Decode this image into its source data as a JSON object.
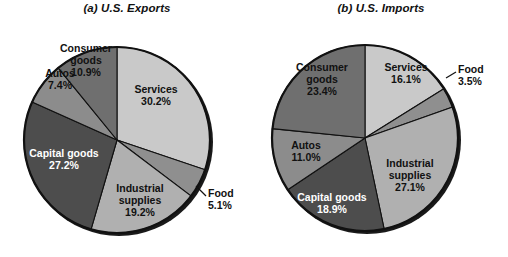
{
  "figure": {
    "background": "#ffffff",
    "panels": [
      {
        "id": "exports",
        "title": "(a) U.S. Exports",
        "center": {
          "x": 117,
          "y": 140
        },
        "radius": 93
      },
      {
        "id": "imports",
        "title": "(b) U.S. Imports",
        "center": {
          "x": 111,
          "y": 138
        },
        "radius": 93
      }
    ]
  },
  "chart_data": [
    {
      "type": "pie",
      "title": "(a) U.S. Exports",
      "xlabel": "",
      "ylabel": "",
      "legend": "none",
      "start_angle_deg": 0,
      "direction": "clockwise",
      "categories": [
        "Services",
        "Food",
        "Industrial supplies",
        "Capital goods",
        "Autos",
        "Consumer goods"
      ],
      "values": [
        30.2,
        5.1,
        19.2,
        27.2,
        7.4,
        10.9
      ],
      "value_labels": [
        "30.2%",
        "5.1%",
        "19.2%",
        "27.2%",
        "7.4%",
        "10.9%"
      ],
      "colors": [
        "#c9c9c9",
        "#8f8f8f",
        "#b0b0b0",
        "#4d4d4d",
        "#8c8c8c",
        "#6f6f6f"
      ],
      "label_text_colors": [
        "#111111",
        "#111111",
        "#111111",
        "#ffffff",
        "#111111",
        "#111111"
      ],
      "slices": [
        {
          "name": "Services",
          "value": 30.2,
          "label": "Services",
          "value_label": "30.2%",
          "color": "#c9c9c9",
          "label_placement": "inside"
        },
        {
          "name": "Food",
          "value": 5.1,
          "label": "Food",
          "value_label": "5.1%",
          "color": "#8f8f8f",
          "label_placement": "outside-leader"
        },
        {
          "name": "Industrial supplies",
          "value": 19.2,
          "label_line1": "Industrial",
          "label_line2": "supplies",
          "value_label": "19.2%",
          "color": "#b0b0b0",
          "label_placement": "inside"
        },
        {
          "name": "Capital goods",
          "value": 27.2,
          "label": "Capital goods",
          "value_label": "27.2%",
          "color": "#4d4d4d",
          "label_placement": "inside"
        },
        {
          "name": "Autos",
          "value": 7.4,
          "label": "Autos",
          "value_label": "7.4%",
          "color": "#8c8c8c",
          "label_placement": "inside"
        },
        {
          "name": "Consumer goods",
          "value": 10.9,
          "label_line1": "Consumer",
          "label_line2": "goods",
          "value_label": "10.9%",
          "color": "#6f6f6f",
          "label_placement": "inside"
        }
      ]
    },
    {
      "type": "pie",
      "title": "(b) U.S. Imports",
      "xlabel": "",
      "ylabel": "",
      "legend": "none",
      "start_angle_deg": 0,
      "direction": "clockwise",
      "categories": [
        "Services",
        "Food",
        "Industrial supplies",
        "Capital goods",
        "Autos",
        "Consumer goods"
      ],
      "values": [
        16.1,
        3.5,
        27.1,
        18.9,
        11.0,
        23.4
      ],
      "value_labels": [
        "16.1%",
        "3.5%",
        "27.1%",
        "18.9%",
        "11.0%",
        "23.4%"
      ],
      "colors": [
        "#c9c9c9",
        "#8f8f8f",
        "#b0b0b0",
        "#4d4d4d",
        "#8c8c8c",
        "#6f6f6f"
      ],
      "label_text_colors": [
        "#111111",
        "#111111",
        "#111111",
        "#ffffff",
        "#111111",
        "#111111"
      ],
      "slices": [
        {
          "name": "Services",
          "value": 16.1,
          "label": "Services",
          "value_label": "16.1%",
          "color": "#c9c9c9",
          "label_placement": "inside"
        },
        {
          "name": "Food",
          "value": 3.5,
          "label": "Food",
          "value_label": "3.5%",
          "color": "#8f8f8f",
          "label_placement": "outside-leader"
        },
        {
          "name": "Industrial supplies",
          "value": 27.1,
          "label_line1": "Industrial",
          "label_line2": "supplies",
          "value_label": "27.1%",
          "color": "#b0b0b0",
          "label_placement": "inside"
        },
        {
          "name": "Capital goods",
          "value": 18.9,
          "label": "Capital goods",
          "value_label": "18.9%",
          "color": "#4d4d4d",
          "label_placement": "inside"
        },
        {
          "name": "Autos",
          "value": 11.0,
          "label": "Autos",
          "value_label": "11.0%",
          "color": "#8c8c8c",
          "label_placement": "inside"
        },
        {
          "name": "Consumer goods",
          "value": 23.4,
          "label_line1": "Consumer",
          "label_line2": "goods",
          "value_label": "23.4%",
          "color": "#6f6f6f",
          "label_placement": "inside"
        }
      ]
    }
  ],
  "labels": {
    "exports": {
      "services_name": "Services",
      "services_pct": "30.2%",
      "food_name": "Food",
      "food_pct": "5.1%",
      "industrial_l1": "Industrial",
      "industrial_l2": "supplies",
      "industrial_pct": "19.2%",
      "capital_name": "Capital goods",
      "capital_pct": "27.2%",
      "autos_name": "Autos",
      "autos_pct": "7.4%",
      "consumer_l1": "Consumer",
      "consumer_l2": "goods",
      "consumer_pct": "10.9%"
    },
    "imports": {
      "services_name": "Services",
      "services_pct": "16.1%",
      "food_name": "Food",
      "food_pct": "3.5%",
      "industrial_l1": "Industrial",
      "industrial_l2": "supplies",
      "industrial_pct": "27.1%",
      "capital_name": "Capital goods",
      "capital_pct": "18.9%",
      "autos_name": "Autos",
      "autos_pct": "11.0%",
      "consumer_l1": "Consumer",
      "consumer_l2": "goods",
      "consumer_pct": "23.4%"
    }
  }
}
